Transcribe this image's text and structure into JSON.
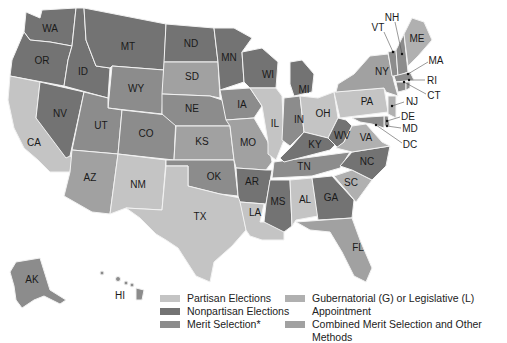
{
  "colors": {
    "partisan": "#c4c4c4",
    "nonpartisan": "#737373",
    "merit": "#8c8c8c",
    "appointment": "#b0b0b0",
    "combined": "#a1a1a1",
    "border": "#f2f2f2",
    "background": "#ffffff"
  },
  "states": [
    {
      "abbr": "WA",
      "method": "nonpartisan"
    },
    {
      "abbr": "OR",
      "method": "nonpartisan"
    },
    {
      "abbr": "ID",
      "method": "nonpartisan"
    },
    {
      "abbr": "MT",
      "method": "nonpartisan"
    },
    {
      "abbr": "ND",
      "method": "nonpartisan"
    },
    {
      "abbr": "MN",
      "method": "nonpartisan"
    },
    {
      "abbr": "WI",
      "method": "nonpartisan"
    },
    {
      "abbr": "MI",
      "method": "nonpartisan"
    },
    {
      "abbr": "NV",
      "method": "nonpartisan"
    },
    {
      "abbr": "AR",
      "method": "nonpartisan"
    },
    {
      "abbr": "MS",
      "method": "nonpartisan"
    },
    {
      "abbr": "GA",
      "method": "nonpartisan"
    },
    {
      "abbr": "KY",
      "method": "nonpartisan"
    },
    {
      "abbr": "NC",
      "method": "nonpartisan"
    },
    {
      "abbr": "WV",
      "method": "nonpartisan"
    },
    {
      "abbr": "WY",
      "method": "merit"
    },
    {
      "abbr": "NE",
      "method": "merit"
    },
    {
      "abbr": "IA",
      "method": "merit"
    },
    {
      "abbr": "CO",
      "method": "merit"
    },
    {
      "abbr": "UT",
      "method": "merit"
    },
    {
      "abbr": "AK",
      "method": "merit"
    },
    {
      "abbr": "OK",
      "method": "merit"
    },
    {
      "abbr": "TN",
      "method": "merit"
    },
    {
      "abbr": "IN",
      "method": "merit"
    },
    {
      "abbr": "CT",
      "method": "merit"
    },
    {
      "abbr": "DE",
      "method": "merit"
    },
    {
      "abbr": "MD",
      "method": "merit"
    },
    {
      "abbr": "VT",
      "method": "merit"
    },
    {
      "abbr": "HI",
      "method": "merit"
    },
    {
      "abbr": "DC",
      "method": "merit"
    },
    {
      "abbr": "RI",
      "method": "merit"
    },
    {
      "abbr": "MA",
      "method": "merit"
    },
    {
      "abbr": "NH",
      "method": "merit"
    },
    {
      "abbr": "IL",
      "method": "partisan"
    },
    {
      "abbr": "TX",
      "method": "partisan"
    },
    {
      "abbr": "NM",
      "method": "partisan"
    },
    {
      "abbr": "AL",
      "method": "partisan"
    },
    {
      "abbr": "LA",
      "method": "partisan"
    },
    {
      "abbr": "PA",
      "method": "partisan"
    },
    {
      "abbr": "OH",
      "method": "partisan"
    },
    {
      "abbr": "CA",
      "method": "partisan"
    },
    {
      "abbr": "VA",
      "method": "appointment"
    },
    {
      "abbr": "SC",
      "method": "appointment"
    },
    {
      "abbr": "NJ",
      "method": "appointment"
    },
    {
      "abbr": "ME",
      "method": "appointment"
    },
    {
      "abbr": "SD",
      "method": "combined"
    },
    {
      "abbr": "KS",
      "method": "combined"
    },
    {
      "abbr": "MO",
      "method": "combined"
    },
    {
      "abbr": "AZ",
      "method": "combined"
    },
    {
      "abbr": "FL",
      "method": "combined"
    },
    {
      "abbr": "NY",
      "method": "combined"
    }
  ],
  "legend": {
    "items": [
      {
        "key": "partisan",
        "label": "Partisan Elections"
      },
      {
        "key": "nonpartisan",
        "label": "Nonpartisan Elections"
      },
      {
        "key": "merit",
        "label": "Merit Selection*"
      },
      {
        "key": "appointment",
        "label": "Gubernatorial (G) or Legislative (L) Appointment"
      },
      {
        "key": "combined",
        "label": "Combined Merit Selection and Other Methods"
      }
    ]
  },
  "labels": {
    "WA": "WA",
    "OR": "OR",
    "ID": "ID",
    "MT": "MT",
    "ND": "ND",
    "MN": "MN",
    "WI": "WI",
    "MI": "MI",
    "SD": "SD",
    "WY": "WY",
    "NE": "NE",
    "IA": "IA",
    "IL": "IL",
    "IN": "IN",
    "OH": "OH",
    "PA": "PA",
    "NY": "NY",
    "NV": "NV",
    "UT": "UT",
    "CO": "CO",
    "KS": "KS",
    "MO": "MO",
    "KY": "KY",
    "WV": "WV",
    "VA": "VA",
    "CA": "CA",
    "AZ": "AZ",
    "NM": "NM",
    "OK": "OK",
    "AR": "AR",
    "TN": "TN",
    "NC": "NC",
    "SC": "SC",
    "TX": "TX",
    "LA": "LA",
    "MS": "MS",
    "AL": "AL",
    "GA": "GA",
    "FL": "FL",
    "AK": "AK",
    "HI": "HI",
    "ME": "ME",
    "VT": "VT",
    "NH": "NH",
    "MA": "MA",
    "RI": "RI",
    "CT": "CT",
    "NJ": "NJ",
    "DE": "DE",
    "MD": "MD",
    "DC": "DC"
  }
}
